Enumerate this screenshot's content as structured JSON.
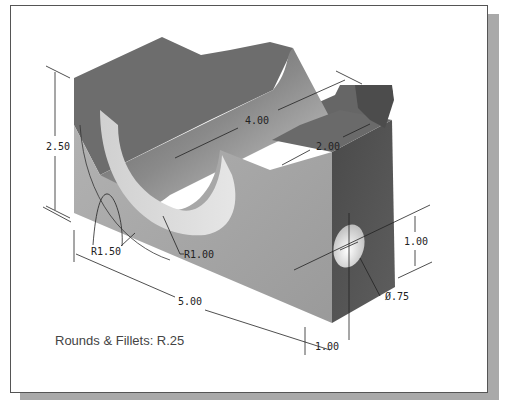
{
  "figure": {
    "type": "isometric-part-drawing",
    "note": "Rounds & Fillets: R.25",
    "colors": {
      "frame_border": "#555555",
      "shadow": "#a9a9a9",
      "top_face": "#6e6e6e",
      "left_face": "#a8a8a8",
      "right_face": "#545454",
      "dimension_line": "#222222"
    }
  },
  "dimensions": {
    "height": "2.50",
    "length": "5.00",
    "groove_length": "4.00",
    "slot_width": "2.00",
    "outer_radius": "R1.50",
    "inner_radius": "R1.00",
    "hole_diameter": "Ø.75",
    "hole_height": "1.00",
    "hole_offset": "1.00"
  }
}
